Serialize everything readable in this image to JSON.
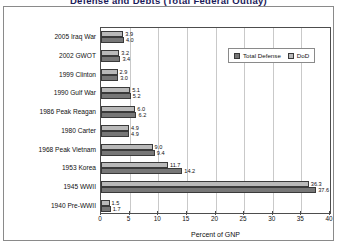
{
  "title_partial": "Defense and Debts (Total Federal Outlay)",
  "chart_data": {
    "type": "bar",
    "orientation": "horizontal",
    "title": "Defense and Debts (Total Federal Outlay)",
    "xlabel": "Percent of GNP",
    "ylabel": "",
    "xlim": [
      0,
      40
    ],
    "xticks": [
      0,
      5,
      10,
      15,
      20,
      25,
      30,
      35,
      40
    ],
    "grid": "vertical",
    "legend_position": "top-right",
    "categories": [
      "2005 Iraq War",
      "2002 GWOT",
      "1999 Clinton",
      "1990 Gulf War",
      "1986 Peak Reagan",
      "1980 Carter",
      "1968 Peak Vietnam",
      "1953 Korea",
      "1945 WWII",
      "1940 Pre-WWII"
    ],
    "series": [
      {
        "name": "DoD",
        "color": "#b9b9b9",
        "values": [
          3.9,
          3.2,
          2.9,
          5.1,
          6.0,
          4.9,
          9.0,
          11.7,
          36.3,
          1.5
        ]
      },
      {
        "name": "Total Defense",
        "color": "#777777",
        "values": [
          4.0,
          3.4,
          3.0,
          5.2,
          6.2,
          4.9,
          9.4,
          14.2,
          37.6,
          1.7
        ]
      }
    ],
    "data_labels": [
      {
        "category": "2005 Iraq War",
        "dod": "3.9",
        "total_defense": "4.0"
      },
      {
        "category": "2002 GWOT",
        "dod": "3.2",
        "total_defense": "3.4"
      },
      {
        "category": "1999 Clinton",
        "dod": "2.9",
        "total_defense": "3.0"
      },
      {
        "category": "1990 Gulf War",
        "dod": "5.1",
        "total_defense": "5.2"
      },
      {
        "category": "1986 Peak Reagan",
        "dod": "6.0",
        "total_defense": "6.2"
      },
      {
        "category": "1980 Carter",
        "dod": "4.9",
        "total_defense": "4.9"
      },
      {
        "category": "1968 Peak Vietnam",
        "dod": "9.0",
        "total_defense": "9.4"
      },
      {
        "category": "1953 Korea",
        "dod": "11.7",
        "total_defense": "14.2"
      },
      {
        "category": "1945 WWII",
        "dod": "36.3",
        "total_defense": "37.6"
      },
      {
        "category": "1940 Pre-WWII",
        "dod": "1.5",
        "total_defense": "1.7"
      }
    ]
  },
  "legend": {
    "items": [
      {
        "label": "Total Defense",
        "color": "#777777"
      },
      {
        "label": "DoD",
        "color": "#b9b9b9"
      }
    ]
  }
}
